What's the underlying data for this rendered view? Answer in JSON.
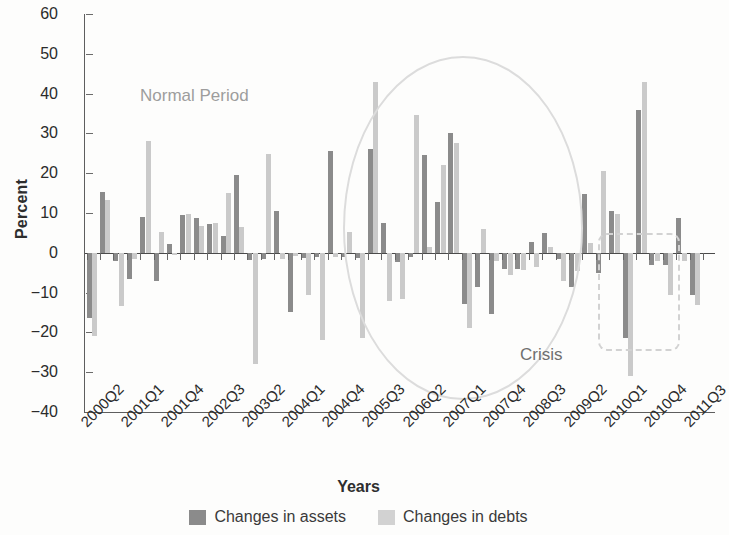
{
  "chart_data": {
    "type": "bar",
    "title": "",
    "xlabel": "Years",
    "ylabel": "Percent",
    "ylim": [
      -40,
      60
    ],
    "ytick_values": [
      60,
      50,
      40,
      30,
      20,
      10,
      0,
      -10,
      -20,
      -30,
      -40
    ],
    "ytick_labels": [
      "60",
      "50",
      "40",
      "30",
      "20",
      "10",
      "0",
      "−10",
      "−20",
      "−30",
      "−40"
    ],
    "grid": false,
    "legend_position": "bottom",
    "colors": {
      "assets": "#8b8b8b",
      "debts": "#cacaca",
      "annotation": "#d2d2d2"
    },
    "categories": [
      "2000Q2",
      "2000Q3",
      "2000Q4",
      "2001Q1",
      "2001Q2",
      "2001Q3",
      "2001Q4",
      "2002Q1",
      "2002Q2",
      "2002Q3",
      "2002Q4",
      "2003Q1",
      "2003Q2",
      "2003Q3",
      "2003Q4",
      "2004Q1",
      "2004Q2",
      "2004Q3",
      "2004Q4",
      "2005Q1",
      "2005Q2",
      "2005Q3",
      "2005Q4",
      "2006Q1",
      "2006Q2",
      "2006Q3",
      "2006Q4",
      "2007Q1",
      "2007Q2",
      "2007Q3",
      "2007Q4",
      "2008Q1",
      "2008Q2",
      "2008Q3",
      "2008Q4",
      "2009Q1",
      "2009Q2",
      "2009Q3",
      "2009Q4",
      "2010Q1",
      "2010Q2",
      "2010Q3",
      "2010Q4",
      "2011Q1",
      "2011Q2",
      "2011Q3",
      "2011Q4"
    ],
    "xtick_labels": [
      "2000Q2",
      "2001Q1",
      "2001Q4",
      "2002Q3",
      "2003Q2",
      "2004Q1",
      "2004Q4",
      "2005Q3",
      "2006Q2",
      "2007Q1",
      "2007Q4",
      "2008Q3",
      "2009Q2",
      "2010Q1",
      "2010Q4",
      "2011Q3"
    ],
    "xtick_indices": [
      0,
      3,
      6,
      9,
      12,
      15,
      18,
      21,
      24,
      27,
      30,
      33,
      36,
      39,
      42,
      45
    ],
    "series": [
      {
        "name": "Changes in assets",
        "color": "#8b8b8b",
        "values": [
          -16.5,
          15.3,
          -2.0,
          -6.5,
          9.0,
          -7.0,
          2.3,
          9.5,
          8.8,
          7.2,
          4.2,
          19.5,
          -1.8,
          -1.5,
          10.4,
          -15.0,
          -1.3,
          -1.0,
          25.5,
          -1.0,
          -1.2,
          26.0,
          7.5,
          -2.2,
          -1.0,
          24.5,
          12.8,
          30.0,
          -12.8,
          -8.5,
          -15.5,
          -4.0,
          -4.0,
          2.8,
          5.0,
          -1.5,
          -8.5,
          14.8,
          -5.0,
          10.4,
          -21.5,
          36.0,
          -3.0,
          -3.0,
          8.8,
          -10.5,
          0.0
        ]
      },
      {
        "name": "Changes in debts",
        "color": "#cacaca",
        "values": [
          -21.0,
          13.3,
          -13.3,
          -1.5,
          28.0,
          5.2,
          -0.5,
          9.8,
          6.8,
          7.5,
          15.0,
          6.5,
          -28.0,
          24.8,
          -1.5,
          -0.8,
          -10.5,
          -22.0,
          -1.0,
          5.2,
          -21.5,
          43.0,
          -12.0,
          -11.5,
          34.5,
          1.5,
          22.0,
          27.5,
          -19.0,
          6.0,
          -2.0,
          -5.5,
          -4.2,
          -3.5,
          1.5,
          -7.0,
          -4.5,
          2.5,
          20.5,
          9.8,
          -31.0,
          43.0,
          -2.0,
          -10.5,
          -2.0,
          -13.0,
          0.0
        ]
      }
    ],
    "annotations": [
      {
        "kind": "ellipse",
        "label": "Normal Period",
        "from": "2003Q2",
        "to": "2008Q1"
      },
      {
        "kind": "dashed-box",
        "label": "Crisis",
        "from": "2008Q3",
        "to": "2009Q3"
      }
    ]
  },
  "legend": {
    "items": [
      {
        "label": "Changes in assets",
        "swatch": "assets"
      },
      {
        "label": "Changes in debts",
        "swatch": "debts"
      }
    ]
  }
}
